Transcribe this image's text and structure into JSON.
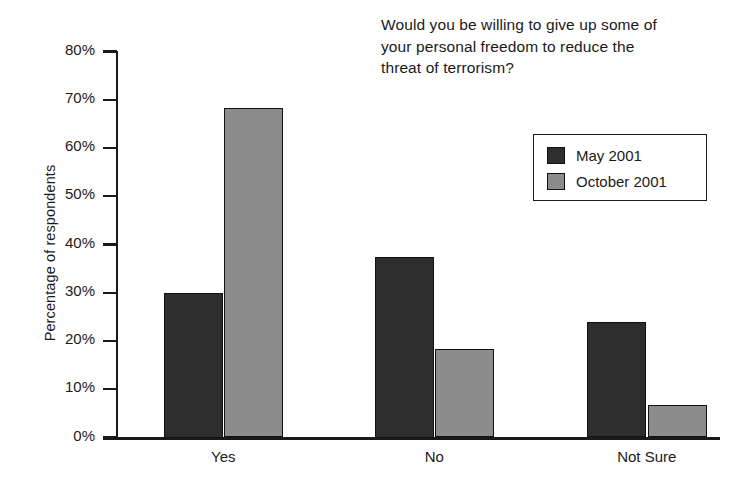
{
  "chart_data": {
    "type": "bar",
    "title": "Would you be willing to give up some of\nyour personal freedom to reduce the\nthreat of terrorism?",
    "xlabel": "",
    "ylabel": "Percentage of respondents",
    "categories": [
      "Yes",
      "No",
      "Not Sure"
    ],
    "series": [
      {
        "name": "May 2001",
        "color": "#2e2e2e",
        "values": [
          30.0,
          37.5,
          24.0
        ]
      },
      {
        "name": "October 2001",
        "color": "#8c8c8c",
        "values": [
          68.3,
          18.4,
          6.8
        ]
      }
    ],
    "ylim": [
      0,
      80
    ],
    "ytick_values": [
      0,
      10,
      20,
      30,
      40,
      50,
      60,
      70,
      80
    ],
    "ytick_labels": [
      "0%",
      "10%",
      "20%",
      "30%",
      "40%",
      "50%",
      "60%",
      "70%",
      "80%"
    ],
    "grid": false,
    "legend_position": "upper-right",
    "legend_entries": [
      "May 2001",
      "October 2001"
    ]
  }
}
